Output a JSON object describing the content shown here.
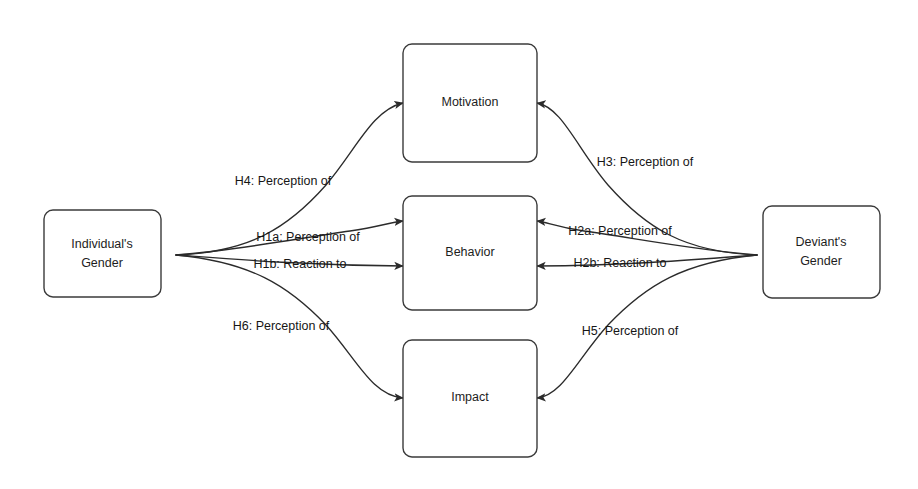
{
  "diagram": {
    "background_color": "#ffffff",
    "line_color": "#2b2b2b",
    "box_stroke_color": "#3b3b3b",
    "box_fill_color": "#ffffff",
    "text_color": "#161616",
    "nodes": [
      {
        "id": "individuals-gender",
        "label_line1": "Individual's",
        "label_line2": "Gender"
      },
      {
        "id": "motivation",
        "label_line1": "Motivation",
        "label_line2": ""
      },
      {
        "id": "behavior",
        "label_line1": "Behavior",
        "label_line2": ""
      },
      {
        "id": "impact",
        "label_line1": "Impact",
        "label_line2": ""
      },
      {
        "id": "deviants-gender",
        "label_line1": "Deviant's",
        "label_line2": "Gender"
      }
    ],
    "edges": [
      {
        "id": "h4",
        "label": "H4: Perception of",
        "from": "individuals-gender",
        "to": "motivation"
      },
      {
        "id": "h1a",
        "label": "H1a: Perception of",
        "from": "individuals-gender",
        "to": "behavior"
      },
      {
        "id": "h1b",
        "label": "H1b: Reaction to",
        "from": "individuals-gender",
        "to": "behavior"
      },
      {
        "id": "h6",
        "label": "H6: Perception of",
        "from": "individuals-gender",
        "to": "impact"
      },
      {
        "id": "h3",
        "label": "H3: Perception of",
        "from": "deviants-gender",
        "to": "motivation"
      },
      {
        "id": "h2a",
        "label": "H2a: Perception of",
        "from": "deviants-gender",
        "to": "behavior"
      },
      {
        "id": "h2b",
        "label": "H2b: Reaction to",
        "from": "deviants-gender",
        "to": "behavior"
      },
      {
        "id": "h5",
        "label": "H5: Perception of",
        "from": "deviants-gender",
        "to": "impact"
      }
    ]
  }
}
